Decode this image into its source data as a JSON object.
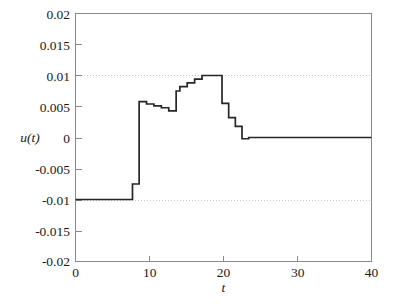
{
  "chart_data": {
    "type": "line",
    "title": "",
    "subtitle": "",
    "xlabel": "t",
    "ylabel": "u(t)",
    "xlim": [
      0,
      40
    ],
    "ylim": [
      -0.02,
      0.02
    ],
    "xticks": [
      0,
      10,
      20,
      30,
      40
    ],
    "yticks": [
      -0.02,
      -0.015,
      -0.01,
      -0.005,
      0,
      0.005,
      0.01,
      0.015,
      0.02
    ],
    "xticklabels": [
      "0",
      "10",
      "20",
      "30",
      "40"
    ],
    "yticklabels": [
      "-0.02",
      "-0.015",
      "-0.01",
      "-0.005",
      "0",
      "0.005",
      "0.01",
      "0.015",
      "0.02"
    ],
    "grid": "horizontal-dotted-at-plus-minus-0.01",
    "gridlines_y": [
      0.01,
      -0.01
    ],
    "legend": null,
    "legend_position": "none",
    "annotations": [],
    "interpolation": "stairs",
    "series": [
      {
        "name": "u(t)",
        "color": "#262626",
        "style": "staircase",
        "x": [
          0,
          7.7,
          8.6,
          9.6,
          10.6,
          11.6,
          12.6,
          13.6,
          14.1,
          15.1,
          16.1,
          17.1,
          19.8,
          20.7,
          21.6,
          22.5,
          23.4,
          40
        ],
        "values": [
          -0.01,
          -0.0075,
          0.0058,
          0.0054,
          0.0051,
          0.0048,
          0.0043,
          0.0075,
          0.0082,
          0.0088,
          0.0094,
          0.01,
          0.0055,
          0.0032,
          0.0018,
          -0.0002,
          0.0,
          0.0
        ]
      }
    ]
  },
  "axes": {
    "box": "open-top-right-spines-light",
    "tick_direction": "in"
  }
}
